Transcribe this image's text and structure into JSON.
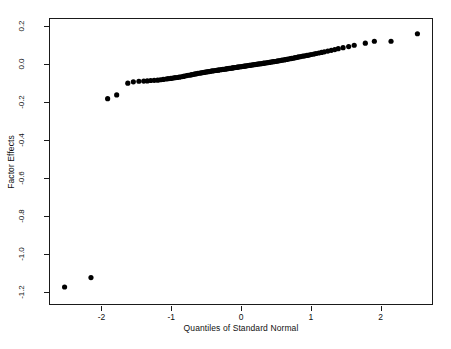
{
  "chart_data": {
    "type": "scatter",
    "title": "",
    "subtitle": "",
    "xlabel": "Quantiles of Standard Normal",
    "ylabel": "Factor Effects",
    "xlim": [
      -2.75,
      2.75
    ],
    "ylim": [
      -1.27,
      0.24
    ],
    "xticks": [
      -2,
      -1,
      0,
      1,
      2
    ],
    "xticklabels": [
      "-2",
      "-1",
      "0",
      "1",
      "2"
    ],
    "yticks": [
      0.2,
      0.0,
      -0.2,
      -0.4,
      -0.6,
      -0.8,
      -1.0,
      -1.2
    ],
    "yticklabels": [
      "0.2",
      "0.0",
      "-0.2",
      "-0.4",
      "-0.6",
      "-0.8",
      "-1.0",
      "-1.2"
    ],
    "grid": false,
    "legend": null,
    "marker": "filled-circle",
    "marker_size": 2.6,
    "marker_color": "#000000",
    "n_points": 127,
    "series": [
      {
        "name": "Factor Effects",
        "x": [
          -2.54,
          -2.16,
          -1.92,
          -1.79,
          -1.63,
          -1.55,
          -1.47,
          -1.4,
          -1.35,
          -1.3,
          -1.25,
          -1.2,
          -1.16,
          -1.12,
          -1.08,
          -1.05,
          -1.01,
          -0.98,
          -0.95,
          -0.92,
          -0.89,
          -0.86,
          -0.83,
          -0.81,
          -0.78,
          -0.76,
          -0.73,
          -0.71,
          -0.68,
          -0.66,
          -0.64,
          -0.62,
          -0.59,
          -0.57,
          -0.55,
          -0.53,
          -0.51,
          -0.49,
          -0.47,
          -0.45,
          -0.43,
          -0.41,
          -0.39,
          -0.37,
          -0.35,
          -0.33,
          -0.32,
          -0.3,
          -0.28,
          -0.26,
          -0.24,
          -0.22,
          -0.21,
          -0.19,
          -0.17,
          -0.15,
          -0.13,
          -0.12,
          -0.1,
          -0.08,
          -0.06,
          -0.05,
          -0.03,
          -0.01,
          0.01,
          0.03,
          0.05,
          0.06,
          0.08,
          0.1,
          0.12,
          0.13,
          0.15,
          0.17,
          0.19,
          0.21,
          0.22,
          0.24,
          0.26,
          0.28,
          0.3,
          0.32,
          0.33,
          0.35,
          0.37,
          0.39,
          0.41,
          0.43,
          0.45,
          0.47,
          0.49,
          0.51,
          0.53,
          0.55,
          0.57,
          0.59,
          0.62,
          0.64,
          0.66,
          0.68,
          0.71,
          0.73,
          0.76,
          0.78,
          0.81,
          0.83,
          0.86,
          0.89,
          0.92,
          0.95,
          0.98,
          1.01,
          1.05,
          1.08,
          1.12,
          1.16,
          1.2,
          1.25,
          1.3,
          1.35,
          1.4,
          1.47,
          1.55,
          1.63,
          1.79,
          1.92,
          2.16,
          2.54
        ],
        "y": [
          -1.18,
          -1.13,
          -0.182,
          -0.162,
          -0.1,
          -0.093,
          -0.09,
          -0.089,
          -0.088,
          -0.086,
          -0.085,
          -0.084,
          -0.082,
          -0.08,
          -0.078,
          -0.076,
          -0.075,
          -0.073,
          -0.071,
          -0.07,
          -0.068,
          -0.066,
          -0.064,
          -0.062,
          -0.06,
          -0.058,
          -0.057,
          -0.055,
          -0.053,
          -0.051,
          -0.05,
          -0.048,
          -0.047,
          -0.045,
          -0.044,
          -0.043,
          -0.041,
          -0.04,
          -0.039,
          -0.038,
          -0.036,
          -0.035,
          -0.034,
          -0.033,
          -0.032,
          -0.031,
          -0.03,
          -0.029,
          -0.028,
          -0.027,
          -0.026,
          -0.025,
          -0.024,
          -0.023,
          -0.022,
          -0.021,
          -0.02,
          -0.019,
          -0.018,
          -0.017,
          -0.016,
          -0.015,
          -0.014,
          -0.013,
          -0.012,
          -0.011,
          -0.01,
          -0.009,
          -0.008,
          -0.007,
          -0.006,
          -0.005,
          -0.004,
          -0.003,
          -0.002,
          -0.001,
          0.0,
          0.001,
          0.002,
          0.003,
          0.004,
          0.005,
          0.006,
          0.007,
          0.008,
          0.009,
          0.01,
          0.012,
          0.013,
          0.014,
          0.015,
          0.016,
          0.018,
          0.019,
          0.02,
          0.022,
          0.023,
          0.025,
          0.026,
          0.028,
          0.03,
          0.031,
          0.033,
          0.035,
          0.037,
          0.039,
          0.041,
          0.043,
          0.045,
          0.047,
          0.049,
          0.052,
          0.054,
          0.057,
          0.06,
          0.063,
          0.066,
          0.07,
          0.074,
          0.078,
          0.083,
          0.088,
          0.094,
          0.101,
          0.112,
          0.122,
          0.122,
          0.162
        ]
      }
    ]
  },
  "axes": {
    "xlabel": "Quantiles of Standard Normal",
    "ylabel": "Factor Effects",
    "xticklabels": [
      "-2",
      "-1",
      "0",
      "1",
      "2"
    ],
    "yticklabels": [
      "0.2",
      "0.0",
      "-0.2",
      "-0.4",
      "-0.6",
      "-0.8",
      "-1.0",
      "-1.2"
    ]
  },
  "style": {
    "frame_color": "#1a1a1a",
    "point_color": "#000000",
    "background": "#ffffff"
  }
}
